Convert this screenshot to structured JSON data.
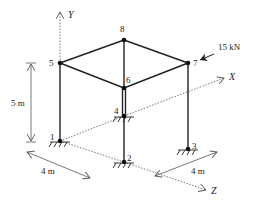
{
  "diagram": {
    "axes": {
      "x": "X",
      "y": "Y",
      "z": "Z"
    },
    "nodes": [
      {
        "id": "1",
        "label": "1",
        "x": 60,
        "y": 141
      },
      {
        "id": "2",
        "label": "2",
        "x": 124,
        "y": 162
      },
      {
        "id": "3",
        "label": "3",
        "x": 188,
        "y": 149
      },
      {
        "id": "4",
        "label": "4",
        "x": 124,
        "y": 116
      },
      {
        "id": "5",
        "label": "5",
        "x": 60,
        "y": 63
      },
      {
        "id": "6",
        "label": "6",
        "x": 124,
        "y": 88
      },
      {
        "id": "7",
        "label": "7",
        "x": 188,
        "y": 63
      },
      {
        "id": "8",
        "label": "8",
        "x": 124,
        "y": 40
      }
    ],
    "load": {
      "label": "15 kN",
      "node": "7"
    },
    "dimensions": {
      "height": "5 m",
      "width_z": "4 m",
      "width_x": "4 m"
    },
    "colors": {
      "line": "#222222",
      "axis": "#555555"
    }
  }
}
